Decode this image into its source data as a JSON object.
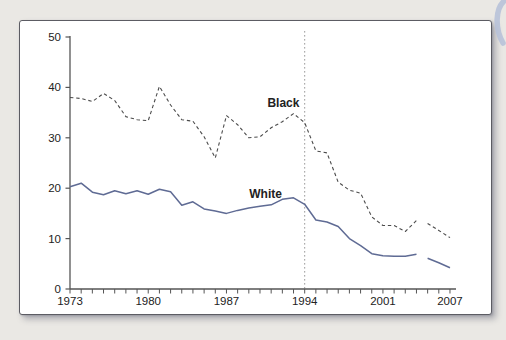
{
  "page": {
    "background_color": "#eae8e4",
    "panel_border_color": "#5c5c63",
    "decoration_name": "page-curl-arc",
    "decoration_color": "#b5c0d8"
  },
  "chart_data": {
    "type": "line",
    "title": "",
    "xlabel": "",
    "ylabel": "",
    "grid": false,
    "legend_position": "inline-labels",
    "ylim": [
      0,
      50
    ],
    "y_ticks": [
      0,
      10,
      20,
      30,
      40,
      50
    ],
    "x": [
      1973,
      1974,
      1975,
      1976,
      1977,
      1978,
      1979,
      1980,
      1981,
      1982,
      1983,
      1984,
      1985,
      1986,
      1987,
      1988,
      1989,
      1990,
      1991,
      1992,
      1993,
      1994,
      1995,
      1996,
      1997,
      1998,
      1999,
      2000,
      2001,
      2002,
      2003,
      2004,
      2005,
      2006,
      2007
    ],
    "x_tick_labels": [
      "1973",
      "1980",
      "1987",
      "1994",
      "2001",
      "2007"
    ],
    "x_tick_label_years": [
      1973,
      1980,
      1987,
      1994,
      2001,
      2007
    ],
    "minor_tick_every_year": true,
    "reference_line": {
      "at_year": 1994,
      "style": "dotted",
      "color": "#9a9a9a"
    },
    "series_break_after_year": 2004,
    "axis_color": "#555555",
    "tick_label_color": "#222222",
    "series": [
      {
        "name": "Black",
        "line_style": "dashed",
        "color": "#4b4b4b",
        "values": [
          38.0,
          37.8,
          37.2,
          38.8,
          37.4,
          34.2,
          33.6,
          33.4,
          40.2,
          36.5,
          33.6,
          33.3,
          30.2,
          26.0,
          34.4,
          32.6,
          30.0,
          30.2,
          32.0,
          33.2,
          34.8,
          33.0,
          27.4,
          27.0,
          21.2,
          19.6,
          19.0,
          14.3,
          12.6,
          12.6,
          11.4,
          13.6,
          13.0,
          11.6,
          10.2
        ]
      },
      {
        "name": "White",
        "line_style": "solid",
        "color": "#5f6b94",
        "values": [
          20.3,
          21.0,
          19.2,
          18.7,
          19.5,
          18.9,
          19.5,
          18.8,
          19.8,
          19.3,
          16.6,
          17.3,
          15.9,
          15.5,
          15.0,
          15.6,
          16.1,
          16.4,
          16.7,
          17.8,
          18.1,
          16.8,
          13.7,
          13.3,
          12.4,
          10.0,
          8.6,
          7.0,
          6.6,
          6.5,
          6.5,
          6.9,
          6.1,
          5.2,
          4.2
        ]
      }
    ],
    "annotations": [
      {
        "text": "Black",
        "bold": true,
        "color": "#222222",
        "at_year": 1992.1,
        "at_value": 36.9
      },
      {
        "text": "White",
        "bold": true,
        "color": "#222222",
        "at_year": 1990.5,
        "at_value": 18.9
      }
    ]
  }
}
